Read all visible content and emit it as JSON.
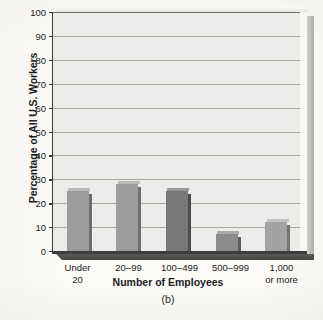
{
  "chart_data": {
    "type": "bar",
    "title": "",
    "caption": "(b)",
    "xlabel": "Number of Employees",
    "ylabel": "Percentage of All U.S. Workers",
    "categories": [
      "Under 20",
      "20–99",
      "100–499",
      "500–999",
      "1,000 or more"
    ],
    "category_lines": [
      [
        "Under",
        "20"
      ],
      [
        "20–99",
        ""
      ],
      [
        "100–499",
        ""
      ],
      [
        "500–999",
        ""
      ],
      [
        "1,000",
        "or more"
      ]
    ],
    "values": [
      25,
      28,
      25,
      7,
      12
    ],
    "ylim": [
      0,
      100
    ],
    "ytick_values": [
      0,
      10,
      20,
      30,
      40,
      50,
      60,
      70,
      80,
      90,
      100
    ],
    "ytick_labels": [
      "0",
      "10",
      "20",
      "30",
      "40",
      "50",
      "60",
      "70",
      "80",
      "90",
      "100"
    ],
    "grid": true,
    "legend": "none",
    "bar_colors": [
      "#9c9c9a",
      "#9c9c9a",
      "#787877",
      "#8b8b89",
      "#a3a3a1"
    ],
    "plot_background": "#ececeb",
    "axis_color": "#3a3a3a",
    "gridline_color": "#a6a6a3"
  }
}
